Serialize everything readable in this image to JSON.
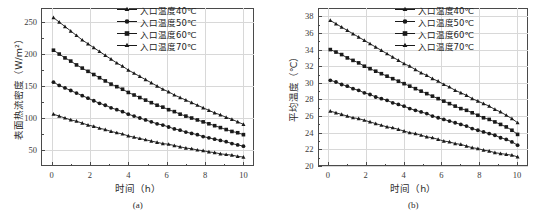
{
  "figure": {
    "panels": [
      {
        "caption": "(a)",
        "xlabel": "时间（h）",
        "ylabel": "表面热流密度（W/m²）",
        "legend_title": "",
        "xticks": [
          "0",
          "2",
          "4",
          "6",
          "8",
          "10"
        ],
        "yticks": [
          "50",
          "100",
          "150",
          "200",
          "250"
        ]
      },
      {
        "caption": "(b)",
        "xlabel": "时间（h）",
        "ylabel": "平均温度（℃）",
        "legend_title": "",
        "xticks": [
          "0",
          "2",
          "4",
          "6",
          "8",
          "10"
        ],
        "yticks": [
          "20",
          "22",
          "24",
          "26",
          "28",
          "30",
          "32",
          "34",
          "36",
          "38"
        ]
      }
    ],
    "legend_labels": [
      "入口温度40℃",
      "入口温度50℃",
      "入口温度60℃",
      "入口温度70℃"
    ],
    "marker_names": [
      "triangle-up-marker",
      "circle-marker",
      "square-marker",
      "triangle-up-marker"
    ],
    "line_color": "#1a1a1a",
    "grid_color": "#d8d8d8",
    "axis_color": "#4a4a4a"
  },
  "chart_data": [
    {
      "type": "line",
      "title": "(a)",
      "xlabel": "时间（h）",
      "ylabel": "表面热流密度（W/m²）",
      "xlim": [
        -0.55,
        10.55
      ],
      "ylim": [
        25,
        272
      ],
      "grid": true,
      "legend_position": "top-right",
      "x": [
        0.1,
        0.4,
        0.7,
        1.0,
        1.3,
        1.6,
        1.9,
        2.2,
        2.5,
        2.8,
        3.1,
        3.4,
        3.7,
        4.0,
        4.3,
        4.6,
        4.9,
        5.2,
        5.5,
        5.8,
        6.1,
        6.4,
        6.7,
        7.0,
        7.3,
        7.6,
        7.9,
        8.2,
        8.5,
        8.8,
        9.1,
        9.4,
        9.7,
        10.0
      ],
      "series": [
        {
          "name": "入口温度70℃",
          "marker": "triangle-up-marker",
          "values": [
            257,
            250,
            243,
            236,
            229,
            222,
            216,
            210,
            204,
            198,
            192,
            186,
            181,
            175,
            170,
            165,
            160,
            155,
            150,
            145,
            141,
            136,
            132,
            128,
            124,
            120,
            116,
            112,
            108,
            105,
            101,
            98,
            94,
            90
          ]
        },
        {
          "name": "入口温度60℃",
          "marker": "square-marker",
          "values": [
            206,
            200,
            194,
            189,
            183,
            178,
            173,
            168,
            163,
            158,
            153,
            149,
            145,
            140,
            136,
            132,
            128,
            124,
            120,
            117,
            113,
            110,
            106,
            103,
            100,
            97,
            94,
            91,
            88,
            85,
            82,
            79,
            77,
            74
          ]
        },
        {
          "name": "入口温度50℃",
          "marker": "circle-marker",
          "values": [
            156,
            151,
            147,
            143,
            139,
            135,
            131,
            127,
            123,
            120,
            116,
            113,
            110,
            106,
            103,
            100,
            97,
            94,
            91,
            89,
            86,
            83,
            81,
            78,
            76,
            74,
            71,
            69,
            67,
            65,
            63,
            60,
            58,
            56
          ]
        },
        {
          "name": "入口温度40℃",
          "marker": "triangle-up-marker",
          "values": [
            106,
            103,
            100,
            97,
            95,
            92,
            89,
            87,
            84,
            82,
            79,
            77,
            75,
            72,
            70,
            68,
            66,
            64,
            62,
            60,
            59,
            57,
            55,
            53,
            52,
            50,
            49,
            47,
            46,
            44,
            43,
            42,
            40,
            39
          ]
        }
      ]
    },
    {
      "type": "line",
      "title": "(b)",
      "xlabel": "时间（h）",
      "ylabel": "平均温度（℃）",
      "xlim": [
        -0.55,
        10.55
      ],
      "ylim": [
        20,
        39
      ],
      "grid": true,
      "legend_position": "top-right",
      "x": [
        0.1,
        0.4,
        0.7,
        1.0,
        1.3,
        1.6,
        1.9,
        2.2,
        2.5,
        2.8,
        3.1,
        3.4,
        3.7,
        4.0,
        4.3,
        4.6,
        4.9,
        5.2,
        5.5,
        5.8,
        6.1,
        6.4,
        6.7,
        7.0,
        7.3,
        7.6,
        7.9,
        8.2,
        8.5,
        8.8,
        9.1,
        9.4,
        9.7,
        10.0
      ],
      "series": [
        {
          "name": "入口温度70℃",
          "marker": "triangle-up-marker",
          "values": [
            37.5,
            37.1,
            36.7,
            36.3,
            35.9,
            35.5,
            35.1,
            34.7,
            34.3,
            33.9,
            33.5,
            33.1,
            32.7,
            32.3,
            32.0,
            31.6,
            31.2,
            30.9,
            30.5,
            30.2,
            29.8,
            29.5,
            29.1,
            28.8,
            28.5,
            28.1,
            27.8,
            27.5,
            27.2,
            26.8,
            26.5,
            26.1,
            25.7,
            25.2
          ]
        },
        {
          "name": "入口温度60℃",
          "marker": "square-marker",
          "values": [
            34.0,
            33.7,
            33.4,
            33.0,
            32.7,
            32.4,
            32.0,
            31.7,
            31.4,
            31.1,
            30.8,
            30.5,
            30.2,
            29.9,
            29.6,
            29.3,
            29.0,
            28.7,
            28.4,
            28.1,
            27.8,
            27.5,
            27.2,
            26.9,
            26.7,
            26.4,
            26.1,
            25.8,
            25.6,
            25.3,
            25.0,
            24.7,
            24.3,
            23.8
          ]
        },
        {
          "name": "入口温度50℃",
          "marker": "circle-marker",
          "values": [
            30.3,
            30.1,
            29.8,
            29.6,
            29.3,
            29.1,
            28.8,
            28.6,
            28.3,
            28.1,
            27.9,
            27.6,
            27.4,
            27.2,
            26.9,
            26.7,
            26.5,
            26.3,
            26.0,
            25.8,
            25.6,
            25.4,
            25.2,
            25.0,
            24.8,
            24.5,
            24.3,
            24.1,
            23.9,
            23.7,
            23.4,
            23.2,
            22.9,
            22.5
          ]
        },
        {
          "name": "入口温度40℃",
          "marker": "triangle-up-marker",
          "values": [
            26.6,
            26.4,
            26.2,
            26.0,
            25.8,
            25.7,
            25.5,
            25.3,
            25.1,
            24.9,
            24.7,
            24.6,
            24.4,
            24.2,
            24.0,
            23.9,
            23.7,
            23.5,
            23.4,
            23.2,
            23.0,
            22.9,
            22.7,
            22.6,
            22.4,
            22.2,
            22.1,
            21.9,
            21.8,
            21.6,
            21.5,
            21.4,
            21.3,
            21.1
          ]
        }
      ]
    }
  ]
}
